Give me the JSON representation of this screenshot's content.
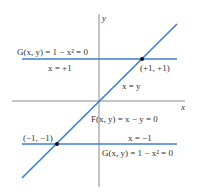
{
  "diagram": {
    "axes": {
      "x_label": "x",
      "y_label": "y",
      "axis_color": "#8a8a8a"
    },
    "lines": [
      {
        "id": "G-upper",
        "equation": "G(x, y) = 1 − x² = 0",
        "sub_label": "x = +1",
        "color": "#3b7fd0"
      },
      {
        "id": "G-lower",
        "equation": "G(x, y) = 1 − x² = 0",
        "sub_label": "x = −1",
        "color": "#3b7fd0"
      },
      {
        "id": "F-diagonal",
        "equation": "F(x, y) = x − y = 0",
        "sub_label": "x = y",
        "color": "#3b7fd0"
      }
    ],
    "points": [
      {
        "label": "(+1, +1)",
        "color": "#111111"
      },
      {
        "label": "(−1, −1)",
        "color": "#111111"
      }
    ]
  }
}
